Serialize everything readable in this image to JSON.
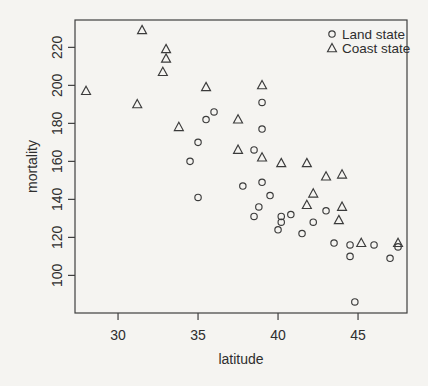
{
  "figure": {
    "background": "#f5f4f1",
    "stroke_color": "#3b3b3b",
    "text_color": "#2e2e2e",
    "box_color": "#3f3f3f"
  },
  "chart_data": {
    "type": "scatter",
    "title": "",
    "xlabel": "latitude",
    "ylabel": "mortality",
    "xlim": [
      27.31,
      48.06
    ],
    "ylim": [
      80.2,
      234.4
    ],
    "x_ticks": [
      30,
      35,
      40,
      45
    ],
    "y_ticks": [
      100,
      120,
      140,
      160,
      180,
      200,
      220
    ],
    "grid": "off",
    "legend": {
      "position": "top-right",
      "border": "none",
      "entries": [
        {
          "label": "Land state",
          "marker": "circle"
        },
        {
          "label": "Coast state",
          "marker": "triangle"
        }
      ]
    },
    "series": [
      {
        "name": "Land state",
        "marker": "circle",
        "points": [
          [
            34.5,
            160
          ],
          [
            35,
            170
          ],
          [
            39,
            149
          ],
          [
            39,
            177
          ],
          [
            44.5,
            116
          ],
          [
            40,
            124
          ],
          [
            40.2,
            128
          ],
          [
            42.2,
            128
          ],
          [
            38.5,
            166
          ],
          [
            37.8,
            147
          ],
          [
            43.5,
            117
          ],
          [
            46,
            116
          ],
          [
            38.5,
            131
          ],
          [
            47,
            109
          ],
          [
            41.5,
            122
          ],
          [
            39,
            191
          ],
          [
            35,
            141
          ],
          [
            47.5,
            115
          ],
          [
            40.2,
            131
          ],
          [
            35.5,
            182
          ],
          [
            40.8,
            132
          ],
          [
            44.8,
            86
          ],
          [
            36,
            186
          ],
          [
            39.5,
            142
          ],
          [
            38.8,
            136
          ],
          [
            44.5,
            110
          ],
          [
            43,
            134
          ]
        ]
      },
      {
        "name": "Coast state",
        "marker": "triangle",
        "points": [
          [
            33,
            219
          ],
          [
            37.5,
            182
          ],
          [
            41.8,
            159
          ],
          [
            39,
            200
          ],
          [
            28,
            197
          ],
          [
            33,
            214
          ],
          [
            31.2,
            190
          ],
          [
            45.2,
            117
          ],
          [
            39,
            162
          ],
          [
            42.2,
            143
          ],
          [
            32.8,
            207
          ],
          [
            43.8,
            129
          ],
          [
            40.2,
            159
          ],
          [
            43,
            152
          ],
          [
            35.5,
            199
          ],
          [
            44,
            136
          ],
          [
            41.8,
            137
          ],
          [
            33.8,
            178
          ],
          [
            31.5,
            229
          ],
          [
            44,
            153
          ],
          [
            37.5,
            166
          ],
          [
            47.5,
            117
          ]
        ]
      }
    ]
  }
}
